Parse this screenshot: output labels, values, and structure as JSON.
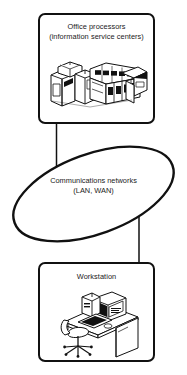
{
  "diagram": {
    "type": "block-diagram",
    "orientation": "vertical",
    "background_color": "#ffffff",
    "stroke_color": "#111111",
    "text_color": "#1a1a1a",
    "nodes": [
      {
        "id": "office-processors",
        "shape": "rounded-rectangle",
        "label_line1": "Office processors",
        "label_line2": "(information service centers)",
        "illustration": "mainframe-equipment-row-icon"
      },
      {
        "id": "communications-networks",
        "shape": "ellipse-tilted",
        "label_line1": "Communications networks",
        "label_line2": "(LAN, WAN)",
        "illustration": "none"
      },
      {
        "id": "workstation",
        "shape": "rounded-rectangle",
        "label_line1": "Workstation",
        "label_line2": "",
        "illustration": "desk-computer-chair-icon"
      }
    ],
    "connectors": [
      {
        "id": "office-processors-to-network",
        "from": "office-processors",
        "to": "communications-networks",
        "style": "solid-line"
      },
      {
        "id": "network-to-workstation",
        "from": "communications-networks",
        "to": "workstation",
        "style": "solid-line"
      }
    ]
  }
}
